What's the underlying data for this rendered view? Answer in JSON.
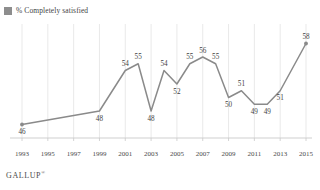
{
  "legend": {
    "label": "% Completely satisfied",
    "swatch_color": "#8d8d8d",
    "icon": "legend-square-icon"
  },
  "footer": {
    "brand": "GALLUP",
    "mark": "®"
  },
  "style": {
    "line_color": "#8a8a8a",
    "grid_color": "#e3e3e3",
    "axis_color": "#c9c9c9",
    "label_color": "#3f3f3f",
    "background": "#ffffff"
  },
  "chart_data": {
    "type": "line",
    "title": "",
    "subtitle": "",
    "xlabel": "",
    "ylabel": "",
    "grid": true,
    "legend_position": "top-left",
    "xlim": [
      1993,
      2015
    ],
    "ylim": [
      44,
      60
    ],
    "tick_labels": [
      "1993",
      "1995",
      "1997",
      "1999",
      "2001",
      "2003",
      "2005",
      "2007",
      "2009",
      "2011",
      "2013",
      "2015"
    ],
    "series": [
      {
        "name": "% Completely satisfied",
        "color": "#8a8a8a",
        "x": [
          1993,
          1999,
          2001,
          2002,
          2003,
          2004,
          2005,
          2006,
          2007,
          2008,
          2009,
          2010,
          2011,
          2012,
          2013,
          2015
        ],
        "values": [
          46,
          48,
          54,
          55,
          48,
          54,
          52,
          55,
          56,
          55,
          50,
          51,
          49,
          49,
          51,
          58
        ],
        "labels": [
          "46",
          "48",
          "54",
          "55",
          "48",
          "54",
          "52",
          "55",
          "56",
          "55",
          "50",
          "51",
          "49",
          "49",
          "51",
          "58"
        ],
        "label_positions": [
          "below",
          "below",
          "above",
          "above",
          "below",
          "above",
          "below",
          "above",
          "above",
          "above",
          "below",
          "above",
          "below",
          "below",
          "below",
          "above"
        ]
      }
    ]
  }
}
